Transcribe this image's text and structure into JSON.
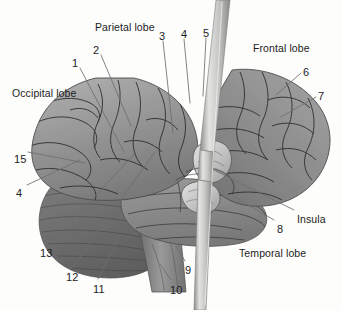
{
  "figure": {
    "background_color": "#fdfdfc",
    "ink_color": "#1c1c1c"
  },
  "palette": {
    "cortex_light": "#a9a9a9",
    "cortex_mid": "#8e8e8e",
    "cortex_dark": "#6f6f6f",
    "cerebellum": "#707070",
    "brainstem": "#8a8a8a",
    "insula_light": "#cfcfcf",
    "probe_light": "#d8d8d6",
    "probe_mid": "#9b9b99",
    "sulcus_line": "#2f2f2f",
    "leader_line": "#6e6e6e"
  },
  "region_labels": [
    {
      "id": "parietal-lobe",
      "text": "Parietal lobe",
      "x": 95,
      "y": 22
    },
    {
      "id": "frontal-lobe",
      "text": "Frontal lobe",
      "x": 253,
      "y": 43
    },
    {
      "id": "occipital-lobe",
      "text": "Occipital lobe",
      "x": 12,
      "y": 88
    },
    {
      "id": "insula",
      "text": "Insula",
      "x": 297,
      "y": 214
    },
    {
      "id": "temporal-lobe",
      "text": "Temporal lobe",
      "x": 239,
      "y": 248
    }
  ],
  "number_labels": [
    {
      "id": "1",
      "text": "1",
      "x": 72,
      "y": 58
    },
    {
      "id": "2",
      "text": "2",
      "x": 93,
      "y": 45
    },
    {
      "id": "3",
      "text": "3",
      "x": 159,
      "y": 31
    },
    {
      "id": "4-top",
      "text": "4",
      "x": 181,
      "y": 29
    },
    {
      "id": "5",
      "text": "5",
      "x": 203,
      "y": 28
    },
    {
      "id": "6",
      "text": "6",
      "x": 303,
      "y": 67
    },
    {
      "id": "7",
      "text": "7",
      "x": 318,
      "y": 91
    },
    {
      "id": "8",
      "text": "8",
      "x": 277,
      "y": 224
    },
    {
      "id": "9",
      "text": "9",
      "x": 185,
      "y": 265
    },
    {
      "id": "10",
      "text": "10",
      "x": 170,
      "y": 285
    },
    {
      "id": "11",
      "text": "11",
      "x": 93,
      "y": 284
    },
    {
      "id": "12",
      "text": "12",
      "x": 66,
      "y": 272
    },
    {
      "id": "13",
      "text": "13",
      "x": 40,
      "y": 248
    },
    {
      "id": "15",
      "text": "15",
      "x": 14,
      "y": 154
    },
    {
      "id": "4-left",
      "text": "4",
      "x": 16,
      "y": 188
    }
  ],
  "leader_lines": [
    {
      "id": "leader-1",
      "from_label": "1",
      "x1": 80,
      "y1": 68,
      "x2": 124,
      "y2": 152
    },
    {
      "id": "leader-2",
      "from_label": "2",
      "x1": 101,
      "y1": 55,
      "x2": 131,
      "y2": 126
    },
    {
      "id": "leader-3",
      "from_label": "3",
      "x1": 163,
      "y1": 41,
      "x2": 173,
      "y2": 133
    },
    {
      "id": "leader-4-top",
      "from_label": "4",
      "x1": 184,
      "y1": 39,
      "x2": 190,
      "y2": 103
    },
    {
      "id": "leader-5",
      "from_label": "5",
      "x1": 206,
      "y1": 38,
      "x2": 203,
      "y2": 96
    },
    {
      "id": "leader-6",
      "from_label": "6",
      "x1": 301,
      "y1": 73,
      "x2": 276,
      "y2": 95
    },
    {
      "id": "leader-7",
      "from_label": "7",
      "x1": 316,
      "y1": 97,
      "x2": 281,
      "y2": 117
    },
    {
      "id": "leader-8",
      "from_label": "8",
      "x1": 274,
      "y1": 220,
      "x2": 233,
      "y2": 196
    },
    {
      "id": "leader-insula",
      "from_label": "Insula",
      "x1": 294,
      "y1": 210,
      "x2": 216,
      "y2": 171
    },
    {
      "id": "leader-9",
      "from_label": "9",
      "x1": 185,
      "y1": 261,
      "x2": 176,
      "y2": 246
    },
    {
      "id": "leader-10",
      "from_label": "10",
      "x1": 171,
      "y1": 280,
      "x2": 160,
      "y2": 264
    },
    {
      "id": "leader-11",
      "from_label": "11",
      "x1": 98,
      "y1": 279,
      "x2": 120,
      "y2": 235
    },
    {
      "id": "leader-12",
      "from_label": "12",
      "x1": 73,
      "y1": 267,
      "x2": 155,
      "y2": 152
    },
    {
      "id": "leader-13",
      "from_label": "13",
      "x1": 50,
      "y1": 245,
      "x2": 136,
      "y2": 152
    },
    {
      "id": "leader-15",
      "from_label": "15",
      "x1": 28,
      "y1": 152,
      "x2": 85,
      "y2": 163
    },
    {
      "id": "leader-4-left",
      "from_label": "4",
      "x1": 27,
      "y1": 185,
      "x2": 80,
      "y2": 160
    }
  ],
  "probe": {
    "id": "vertical-probe",
    "description": "vertical instrument shaft crossing the image",
    "top_x": 222,
    "bottom_x": 201,
    "color_light": "#d8d8d6",
    "color_mid": "#9b9b99"
  }
}
